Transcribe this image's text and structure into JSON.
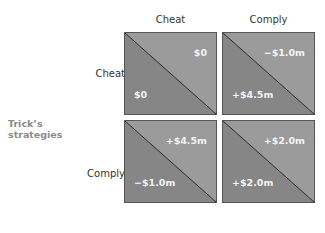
{
  "columns": [
    "Cheat",
    "Comply"
  ],
  "rows": [
    "Cheat",
    "Comply"
  ],
  "row_axis_label": [
    "Trick’s",
    "strategies"
  ],
  "colors": {
    "upper_triangle": "#9b9b9b",
    "lower_triangle": "#868686",
    "diagonal": "#222222"
  },
  "cells": [
    {
      "row": "Cheat",
      "col": "Cheat",
      "upper": "$0",
      "lower": "$0"
    },
    {
      "row": "Cheat",
      "col": "Comply",
      "upper": "−$1.0m",
      "lower": "+$4.5m"
    },
    {
      "row": "Comply",
      "col": "Cheat",
      "upper": "+$4.5m",
      "lower": "−$1.0m"
    },
    {
      "row": "Comply",
      "col": "Comply",
      "upper": "+$2.0m",
      "lower": "+$2.0m"
    }
  ]
}
